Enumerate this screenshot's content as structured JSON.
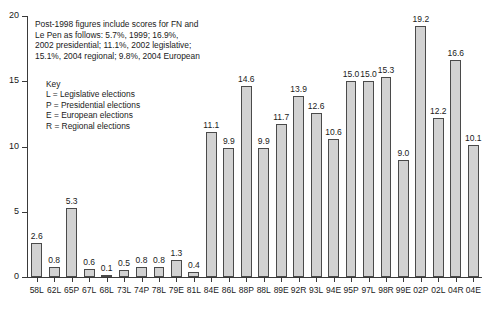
{
  "chart_data": {
    "type": "bar",
    "title": "",
    "xlabel": "",
    "ylabel": "",
    "ylim": [
      0,
      20
    ],
    "yticks": [
      0,
      5,
      10,
      15,
      20
    ],
    "grid": false,
    "legend_position": "inside-upper-left",
    "categories": [
      "58L",
      "62L",
      "65P",
      "67L",
      "68L",
      "73L",
      "74P",
      "78L",
      "79E",
      "81L",
      "84E",
      "86L",
      "88P",
      "88L",
      "89E",
      "92R",
      "93L",
      "94E",
      "95P",
      "97L",
      "98R",
      "99E",
      "02P",
      "02L",
      "04R",
      "04E"
    ],
    "values": [
      2.6,
      0.8,
      5.3,
      0.6,
      0.1,
      0.5,
      0.8,
      0.8,
      1.3,
      0.4,
      11.1,
      9.9,
      14.6,
      9.9,
      11.7,
      13.9,
      12.6,
      10.6,
      15.0,
      15.0,
      15.3,
      9.0,
      19.2,
      12.2,
      16.6,
      10.1
    ],
    "value_labels": [
      "2.6",
      "0.8",
      "5.3",
      "0.6",
      "0.1",
      "0.5",
      "0.8",
      "0.8",
      "1.3",
      "0.4",
      "11.1",
      "9.9",
      "14.6",
      "9.9",
      "11.7",
      "13.9",
      "12.6",
      "10.6",
      "15.0",
      "15.0",
      "15.3",
      "9.0",
      "19.2",
      "12.2",
      "16.6",
      "10.1"
    ],
    "ytick_labels": [
      "0",
      "5",
      "10",
      "15",
      "20"
    ],
    "annotations": [
      "Post-1998 figures include scores for FN and",
      "Le Pen as follows: 5.7%, 1999;  16.9%,",
      "2002 presidential; 11.1%, 2002 legislative;",
      "15.1%, 2004 regional; 9.8%, 2004 European"
    ],
    "legend": {
      "title": "Key",
      "entries": [
        "L = Legislative elections",
        "P = Presidential elections",
        "E = European elections",
        "R = Regional elections"
      ]
    },
    "colors": {
      "bar_fill": "#d2d2d2",
      "bar_border": "#4a4a4a",
      "axis": "#3a3a3a",
      "text": "#1a1a1a",
      "background": "#ffffff"
    }
  }
}
